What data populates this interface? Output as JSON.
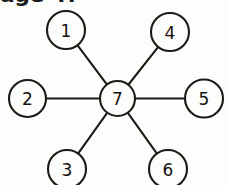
{
  "page": {
    "background_color": "#fdfdfb",
    "ink_color": "#1d1a18",
    "header_remnant_text": "age 4?"
  },
  "diagram": {
    "type": "star-graph",
    "hub": {
      "id": "hub",
      "label": "7",
      "cx": 117.5,
      "cy": 98.5,
      "r": 17.5
    },
    "nodes": [
      {
        "id": "n1",
        "label": "1",
        "cx": 66,
        "cy": 30,
        "r": 19,
        "position": "upper-left"
      },
      {
        "id": "n2",
        "label": "2",
        "cx": 27.5,
        "cy": 98.5,
        "r": 18.5,
        "position": "left"
      },
      {
        "id": "n3",
        "label": "3",
        "cx": 67,
        "cy": 169,
        "r": 19,
        "position": "lower-left"
      },
      {
        "id": "n4",
        "label": "4",
        "cx": 170,
        "cy": 32,
        "r": 19,
        "position": "upper-right"
      },
      {
        "id": "n5",
        "label": "5",
        "cx": 204,
        "cy": 98.5,
        "r": 19,
        "position": "right"
      },
      {
        "id": "n6",
        "label": "6",
        "cx": 168,
        "cy": 169,
        "r": 19,
        "position": "lower-right"
      }
    ],
    "edges": [
      {
        "id": "e1",
        "from": "hub",
        "to": "n1"
      },
      {
        "id": "e2",
        "from": "hub",
        "to": "n2"
      },
      {
        "id": "e3",
        "from": "hub",
        "to": "n3"
      },
      {
        "id": "e4",
        "from": "hub",
        "to": "n4"
      },
      {
        "id": "e5",
        "from": "hub",
        "to": "n5"
      },
      {
        "id": "e6",
        "from": "hub",
        "to": "n6"
      }
    ]
  }
}
